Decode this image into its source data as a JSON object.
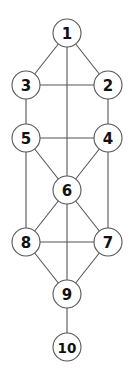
{
  "diagram": {
    "type": "graph",
    "nodes": [
      {
        "id": "1",
        "label": "1"
      },
      {
        "id": "2",
        "label": "2"
      },
      {
        "id": "3",
        "label": "3"
      },
      {
        "id": "4",
        "label": "4"
      },
      {
        "id": "5",
        "label": "5"
      },
      {
        "id": "6",
        "label": "6"
      },
      {
        "id": "7",
        "label": "7"
      },
      {
        "id": "8",
        "label": "8"
      },
      {
        "id": "9",
        "label": "9"
      },
      {
        "id": "10",
        "label": "10"
      }
    ],
    "edges": [
      [
        "1",
        "2"
      ],
      [
        "1",
        "3"
      ],
      [
        "1",
        "6"
      ],
      [
        "2",
        "3"
      ],
      [
        "2",
        "4"
      ],
      [
        "3",
        "5"
      ],
      [
        "4",
        "5"
      ],
      [
        "4",
        "6"
      ],
      [
        "5",
        "6"
      ],
      [
        "4",
        "7"
      ],
      [
        "5",
        "8"
      ],
      [
        "6",
        "7"
      ],
      [
        "6",
        "8"
      ],
      [
        "6",
        "9"
      ],
      [
        "7",
        "8"
      ],
      [
        "7",
        "9"
      ],
      [
        "8",
        "9"
      ],
      [
        "9",
        "10"
      ]
    ],
    "colors": {
      "line": "#555555",
      "node_fill": "#ffffff",
      "text": "#111111"
    }
  }
}
